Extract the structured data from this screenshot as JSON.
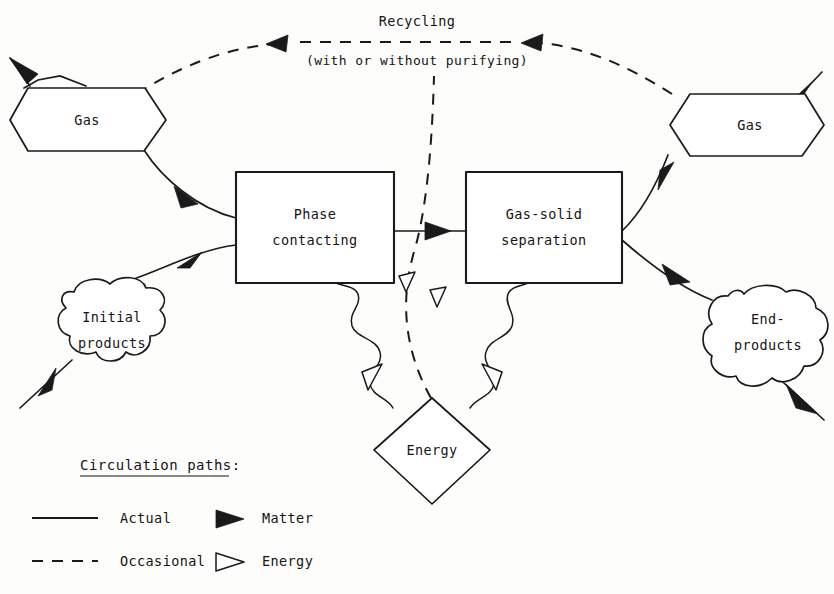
{
  "diagram": {
    "nodes": {
      "gas_left": {
        "label": "Gas",
        "shape": "hexagon"
      },
      "gas_right": {
        "label": "Gas",
        "shape": "hexagon"
      },
      "phase_contacting": {
        "label_line1": "Phase",
        "label_line2": "contacting",
        "shape": "rectangle"
      },
      "gas_solid_separation": {
        "label_line1": "Gas-solid",
        "label_line2": "separation",
        "shape": "rectangle"
      },
      "initial_products": {
        "label_line1": "Initial",
        "label_line2": "products",
        "shape": "cloud"
      },
      "end_products": {
        "label_line1": "End-",
        "label_line2": "products",
        "shape": "cloud"
      },
      "energy": {
        "label": "Energy",
        "shape": "diamond"
      }
    },
    "annotations": {
      "recycling_line1": "Recycling",
      "recycling_line2": "(with or without purifying)"
    },
    "legend": {
      "title": "Circulation paths:",
      "entries": [
        {
          "sample": "solid-line",
          "label": "Actual"
        },
        {
          "sample": "dashed-line",
          "label": "Occasional"
        },
        {
          "sample": "filled-arrowhead",
          "label": "Matter"
        },
        {
          "sample": "hollow-arrowhead",
          "label": "Energy"
        }
      ]
    },
    "colors": {
      "ink": "#1a1a1a",
      "paper": "#fdfdfb"
    }
  }
}
